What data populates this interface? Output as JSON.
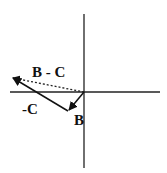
{
  "diagram": {
    "type": "vector-subtraction",
    "labels": {
      "b_minus_c": "B - C",
      "neg_c": "-C",
      "b": "B"
    },
    "colors": {
      "axis": "#222222",
      "vector": "#111111",
      "dashed": "#222222",
      "background": "#ffffff"
    },
    "geometry": {
      "origin": [
        84,
        92
      ],
      "vertical_axis": [
        [
          84,
          14
        ],
        [
          84,
          168
        ]
      ],
      "horizontal_axis": [
        [
          10,
          92
        ],
        [
          160,
          92
        ]
      ],
      "vector_B": [
        [
          84,
          92
        ],
        [
          68,
          111
        ]
      ],
      "vector_neg_C": [
        [
          68,
          111
        ],
        [
          11,
          77
        ]
      ],
      "vector_B_minus_C": [
        [
          84,
          92
        ],
        [
          11,
          77
        ]
      ]
    }
  }
}
